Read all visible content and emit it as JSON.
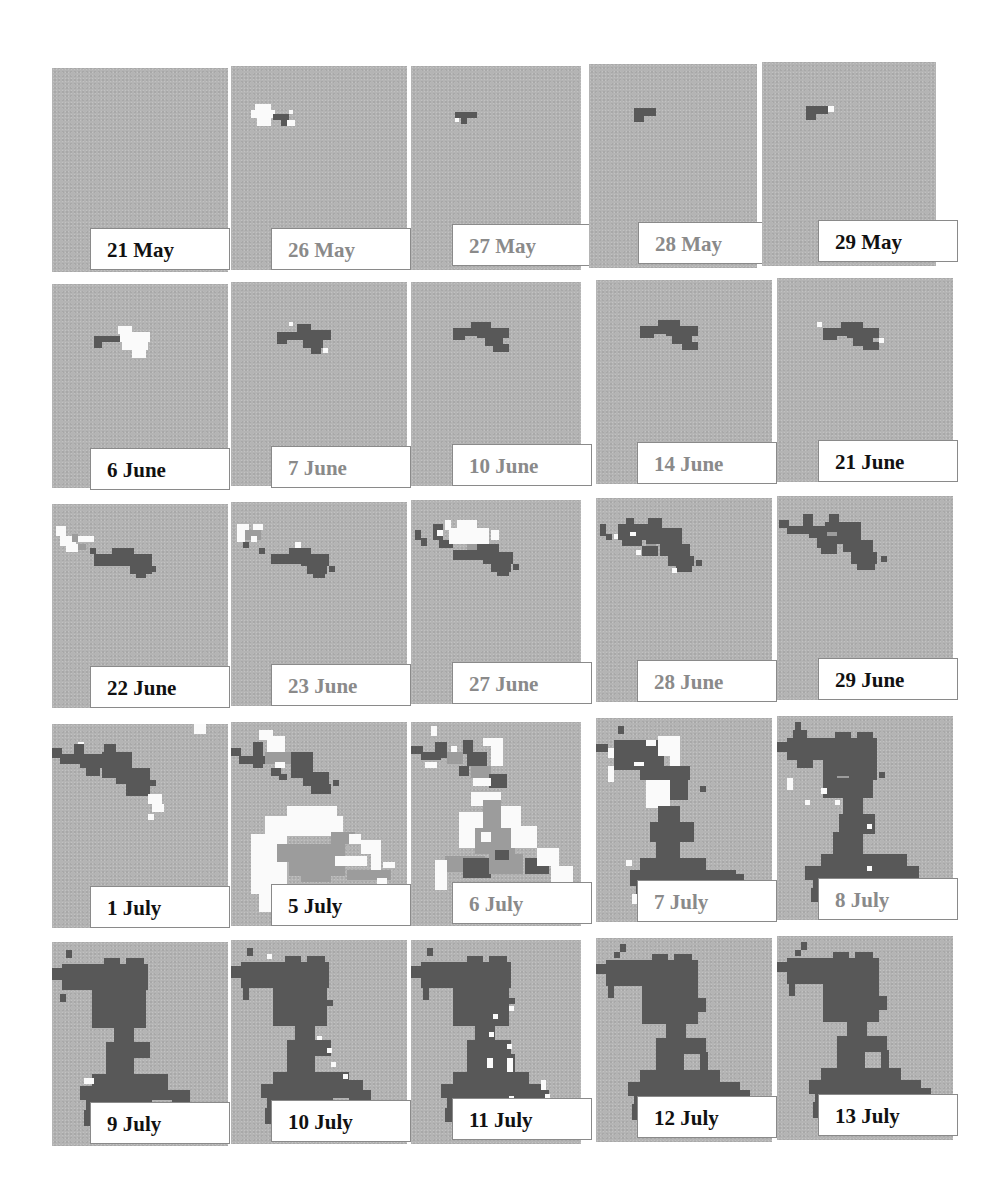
{
  "figure": {
    "grid": {
      "rows": 5,
      "cols": 5
    },
    "colors": {
      "background": "#b4b4b4",
      "dark_cells": "#585858",
      "white_cells": "#fafafa",
      "mid_cells": "#9c9c9c",
      "label_dark_text": "#111111",
      "label_faded_text": "#8a8a8a"
    },
    "panels": [
      {
        "label": "21 May",
        "style": "dark"
      },
      {
        "label": "26 May",
        "style": "faded"
      },
      {
        "label": "27 May",
        "style": "faded"
      },
      {
        "label": "28 May",
        "style": "faded"
      },
      {
        "label": "29 May",
        "style": "dark"
      },
      {
        "label": "6 June",
        "style": "dark"
      },
      {
        "label": "7 June",
        "style": "faded"
      },
      {
        "label": "10 June",
        "style": "faded"
      },
      {
        "label": "14 June",
        "style": "faded"
      },
      {
        "label": "21 June",
        "style": "dark"
      },
      {
        "label": "22 June",
        "style": "dark"
      },
      {
        "label": "23 June",
        "style": "faded"
      },
      {
        "label": "27 June",
        "style": "faded"
      },
      {
        "label": "28 June",
        "style": "faded"
      },
      {
        "label": "29 June",
        "style": "dark"
      },
      {
        "label": "1 July",
        "style": "dark"
      },
      {
        "label": "5 July",
        "style": "dark"
      },
      {
        "label": "6 July",
        "style": "faded"
      },
      {
        "label": "7 July",
        "style": "faded"
      },
      {
        "label": "8 July",
        "style": "faded"
      },
      {
        "label": "9 July",
        "style": "dark"
      },
      {
        "label": "10 July",
        "style": "dark"
      },
      {
        "label": "11 July",
        "style": "dark"
      },
      {
        "label": "12 July",
        "style": "dark"
      },
      {
        "label": "13 July",
        "style": "dark"
      }
    ]
  }
}
